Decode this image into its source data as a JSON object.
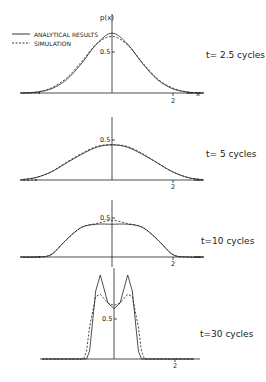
{
  "figure": {
    "y_axis_label": "p(x)",
    "x_axis_label": "x",
    "legend": [
      {
        "label": "ANALYTICAL RESULTS",
        "style": "solid"
      },
      {
        "label": "SIMULATION",
        "style": "dashed"
      }
    ]
  },
  "chart_data": [
    {
      "type": "line",
      "title": "t= 2.5 cycles",
      "xlabel": "x",
      "ylabel": "p(x)",
      "x_ticks": [
        "2"
      ],
      "y_ticks": [
        "0.5"
      ],
      "xlim": [
        -3.2,
        3.0
      ],
      "ylim": [
        0,
        0.95
      ],
      "x": [
        -3,
        -2.5,
        -2,
        -1.5,
        -1,
        -0.5,
        0,
        0.5,
        1,
        1.5,
        2,
        2.5,
        3
      ],
      "series": [
        {
          "name": "ANALYTICAL RESULTS",
          "values": [
            0.0,
            0.01,
            0.05,
            0.16,
            0.36,
            0.6,
            0.73,
            0.6,
            0.36,
            0.16,
            0.05,
            0.01,
            0.0
          ]
        },
        {
          "name": "SIMULATION",
          "values": [
            0.0,
            0.01,
            0.06,
            0.18,
            0.38,
            0.6,
            0.69,
            0.59,
            0.37,
            0.17,
            0.06,
            0.01,
            0.0
          ]
        }
      ]
    },
    {
      "type": "line",
      "title": "t= 5 cycles",
      "x_ticks": [
        "2"
      ],
      "y_ticks": [
        "0.5"
      ],
      "xlim": [
        -3.2,
        3.0
      ],
      "ylim": [
        0,
        0.6
      ],
      "x": [
        -3,
        -2.5,
        -2,
        -1.5,
        -1,
        -0.5,
        0,
        0.5,
        1,
        1.5,
        2,
        2.5,
        3
      ],
      "series": [
        {
          "name": "ANALYTICAL RESULTS",
          "values": [
            0.0,
            0.03,
            0.1,
            0.21,
            0.32,
            0.41,
            0.44,
            0.41,
            0.32,
            0.21,
            0.1,
            0.03,
            0.0
          ]
        },
        {
          "name": "SIMULATION",
          "values": [
            0.0,
            0.03,
            0.1,
            0.22,
            0.33,
            0.42,
            0.44,
            0.42,
            0.33,
            0.21,
            0.1,
            0.03,
            0.0
          ]
        }
      ]
    },
    {
      "type": "line",
      "title": "t=10 cycles",
      "x_ticks": [
        "2"
      ],
      "y_ticks": [
        "0.5"
      ],
      "xlim": [
        -3.2,
        3.0
      ],
      "ylim": [
        0,
        0.6
      ],
      "x": [
        -3,
        -2.5,
        -2,
        -1.5,
        -1,
        -0.5,
        0,
        0.5,
        1,
        1.5,
        2,
        2.5,
        3
      ],
      "series": [
        {
          "name": "ANALYTICAL RESULTS",
          "values": [
            0.0,
            0.0,
            0.03,
            0.22,
            0.38,
            0.42,
            0.42,
            0.42,
            0.38,
            0.22,
            0.03,
            0.0,
            0.0
          ]
        },
        {
          "name": "SIMULATION",
          "values": [
            0.0,
            0.0,
            0.03,
            0.22,
            0.38,
            0.43,
            0.47,
            0.43,
            0.38,
            0.22,
            0.03,
            0.0,
            0.0
          ]
        }
      ]
    },
    {
      "type": "line",
      "title": "t=30 cycles",
      "x_ticks": [
        "2"
      ],
      "y_ticks": [
        "0.5"
      ],
      "xlim": [
        -3.2,
        3.0
      ],
      "ylim": [
        0,
        1.1
      ],
      "x": [
        -1.0,
        -0.9,
        -0.8,
        -0.6,
        -0.45,
        -0.2,
        0,
        0.2,
        0.45,
        0.6,
        0.8,
        0.9,
        1.0
      ],
      "series": [
        {
          "name": "ANALYTICAL RESULTS",
          "values": [
            0.0,
            0.0,
            0.1,
            0.85,
            1.05,
            0.7,
            0.63,
            0.7,
            1.05,
            0.85,
            0.1,
            0.0,
            0.0
          ]
        },
        {
          "name": "SIMULATION",
          "values": [
            0.0,
            0.1,
            0.4,
            0.78,
            0.81,
            0.7,
            0.67,
            0.7,
            0.81,
            0.78,
            0.4,
            0.1,
            0.0
          ]
        }
      ]
    }
  ]
}
